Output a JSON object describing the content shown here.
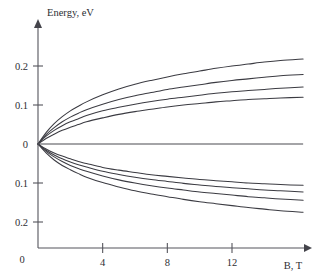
{
  "chart_data": {
    "type": "line",
    "title": "",
    "xlabel": "B, T",
    "ylabel": "Energy, eV",
    "xlim": [
      0,
      16.5
    ],
    "ylim": [
      -0.26,
      0.26
    ],
    "grid": false,
    "legend": "none",
    "x_ticks": [
      {
        "value": 0,
        "label": "0"
      },
      {
        "value": 4,
        "label": "4"
      },
      {
        "value": 8,
        "label": "8"
      },
      {
        "value": 12,
        "label": "12"
      }
    ],
    "y_ticks": [
      {
        "value": 0.2,
        "label": "0.2"
      },
      {
        "value": 0.1,
        "label": "0.1"
      },
      {
        "value": 0.0,
        "label": "0"
      },
      {
        "value": -0.1,
        "label": "0.1"
      },
      {
        "value": -0.2,
        "label": "0.2"
      }
    ],
    "x": [
      0,
      0.5,
      1,
      1.5,
      2,
      2.5,
      3,
      4,
      5,
      6,
      7,
      8,
      9,
      10,
      11,
      12,
      13,
      14,
      15,
      16.4
    ],
    "series": [
      {
        "name": "branch-up-1",
        "values": [
          0,
          0.029,
          0.052,
          0.07,
          0.085,
          0.097,
          0.108,
          0.126,
          0.141,
          0.153,
          0.163,
          0.172,
          0.18,
          0.187,
          0.194,
          0.2,
          0.205,
          0.21,
          0.214,
          0.218
        ]
      },
      {
        "name": "branch-up-2",
        "values": [
          0,
          0.024,
          0.042,
          0.057,
          0.069,
          0.079,
          0.088,
          0.102,
          0.114,
          0.124,
          0.132,
          0.14,
          0.146,
          0.152,
          0.158,
          0.163,
          0.167,
          0.171,
          0.175,
          0.178
        ]
      },
      {
        "name": "branch-up-3",
        "values": [
          0,
          0.02,
          0.035,
          0.047,
          0.057,
          0.065,
          0.073,
          0.085,
          0.094,
          0.102,
          0.109,
          0.115,
          0.12,
          0.125,
          0.13,
          0.134,
          0.137,
          0.14,
          0.143,
          0.146
        ]
      },
      {
        "name": "branch-up-4",
        "values": [
          0,
          0.014,
          0.025,
          0.035,
          0.043,
          0.05,
          0.057,
          0.067,
          0.076,
          0.083,
          0.089,
          0.095,
          0.1,
          0.104,
          0.108,
          0.111,
          0.114,
          0.116,
          0.118,
          0.12
        ]
      },
      {
        "name": "branch-zero",
        "values": [
          0,
          0,
          0,
          0,
          0,
          0,
          0,
          0,
          0,
          0,
          0,
          0,
          0,
          0,
          0,
          0,
          0,
          0,
          0,
          0
        ]
      },
      {
        "name": "branch-down-1",
        "values": [
          0,
          -0.013,
          -0.023,
          -0.031,
          -0.038,
          -0.045,
          -0.05,
          -0.06,
          -0.067,
          -0.073,
          -0.079,
          -0.083,
          -0.087,
          -0.091,
          -0.094,
          -0.097,
          -0.1,
          -0.102,
          -0.104,
          -0.106
        ]
      },
      {
        "name": "branch-down-2",
        "values": [
          0,
          -0.016,
          -0.028,
          -0.038,
          -0.046,
          -0.053,
          -0.059,
          -0.07,
          -0.078,
          -0.085,
          -0.091,
          -0.096,
          -0.101,
          -0.105,
          -0.109,
          -0.112,
          -0.115,
          -0.118,
          -0.12,
          -0.123
        ]
      },
      {
        "name": "branch-down-3",
        "values": [
          0,
          -0.019,
          -0.033,
          -0.045,
          -0.055,
          -0.063,
          -0.07,
          -0.082,
          -0.092,
          -0.1,
          -0.107,
          -0.113,
          -0.118,
          -0.123,
          -0.127,
          -0.131,
          -0.135,
          -0.138,
          -0.141,
          -0.144
        ]
      },
      {
        "name": "branch-down-4",
        "values": [
          0,
          -0.023,
          -0.041,
          -0.055,
          -0.066,
          -0.076,
          -0.085,
          -0.099,
          -0.11,
          -0.12,
          -0.128,
          -0.135,
          -0.142,
          -0.148,
          -0.153,
          -0.158,
          -0.163,
          -0.167,
          -0.171,
          -0.175
        ]
      }
    ]
  },
  "axes": {
    "y_title": "Energy, eV",
    "x_title": "B, T",
    "origin_label": "0"
  }
}
